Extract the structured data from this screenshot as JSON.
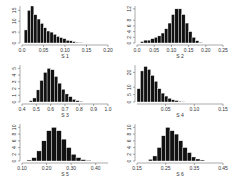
{
  "chart_data": [
    {
      "type": "bar",
      "title": "",
      "xlabel": "S 1",
      "ylabel": "",
      "xlim": [
        0.0,
        0.2
      ],
      "xticks": [
        "0.0",
        "0.05",
        "0.10",
        "0.15",
        "0.20"
      ],
      "yticks": [
        "0",
        "5",
        "10",
        "15"
      ],
      "ylim": [
        0,
        17
      ],
      "bin_start": 0.005,
      "bin_width": 0.0075,
      "values": [
        6,
        15,
        17,
        13,
        11,
        9,
        7,
        5.5,
        5,
        4,
        3,
        2.5,
        2,
        1.2,
        1,
        0.6,
        0.3,
        0.2
      ]
    },
    {
      "type": "bar",
      "title": "",
      "xlabel": "S 2",
      "ylabel": "",
      "xlim": [
        0.0,
        0.25
      ],
      "xticks": [
        "0.0",
        "0.05",
        "0.10",
        "0.15",
        "0.20",
        "0.25"
      ],
      "yticks": [
        "0",
        "2",
        "4",
        "6",
        "8",
        "12"
      ],
      "ylim": [
        0,
        13
      ],
      "bin_start": 0.01,
      "bin_width": 0.01,
      "values": [
        0.5,
        1,
        1,
        1.5,
        2,
        2.5,
        3.5,
        5,
        7,
        10,
        12,
        12,
        10,
        7,
        4,
        2,
        0.8,
        0.2
      ]
    },
    {
      "type": "bar",
      "title": "",
      "xlabel": "S 3",
      "ylabel": "",
      "xlim": [
        0.4,
        1.0
      ],
      "xticks": [
        "0.4",
        "0.5",
        "0.6",
        "0.7",
        "0.8",
        "0.9",
        "1.0"
      ],
      "yticks": [
        "0",
        "1",
        "2",
        "3",
        "4",
        "5"
      ],
      "ylim": [
        0,
        5.5
      ],
      "bin_start": 0.45,
      "bin_width": 0.025,
      "values": [
        0.2,
        0.6,
        1.8,
        3.2,
        4.4,
        5.0,
        4.8,
        3.8,
        2.8,
        1.9,
        1.2,
        0.8,
        0.4,
        0.2,
        0.1
      ]
    },
    {
      "type": "bar",
      "title": "",
      "xlabel": "S 4",
      "ylabel": "",
      "xlim": [
        0.0,
        0.15
      ],
      "xticks": [
        "0.05",
        "0.10",
        "0.15"
      ],
      "yticks": [
        "0",
        "5",
        "10",
        "20"
      ],
      "ylim": [
        0,
        25
      ],
      "bin_start": 0.0,
      "bin_width": 0.006,
      "values": [
        9,
        21,
        24,
        22,
        18,
        14,
        9,
        6,
        4,
        2.5,
        1.5,
        1,
        0.5,
        0.2
      ]
    },
    {
      "type": "bar",
      "title": "",
      "xlabel": "S 5",
      "ylabel": "",
      "xlim": [
        0.1,
        0.45
      ],
      "xticks": [
        "0.10",
        "0.20",
        "0.30",
        "0.40"
      ],
      "yticks": [
        "0",
        "2",
        "4",
        "6",
        "8",
        "10"
      ],
      "ylim": [
        0,
        11
      ],
      "bin_start": 0.12,
      "bin_width": 0.02,
      "values": [
        0.3,
        1,
        3,
        6,
        9,
        10,
        9,
        6.5,
        4,
        2,
        1,
        0.4,
        0.2
      ]
    },
    {
      "type": "bar",
      "title": "",
      "xlabel": "S 6",
      "ylabel": "",
      "xlim": [
        0.15,
        0.45
      ],
      "xticks": [
        "0.15",
        "0.25",
        "0.35",
        "0.45"
      ],
      "yticks": [
        "0",
        "2",
        "4",
        "6",
        "8",
        "10"
      ],
      "ylim": [
        0,
        11
      ],
      "bin_start": 0.19,
      "bin_width": 0.015,
      "values": [
        0.5,
        1.5,
        4,
        7.5,
        10,
        9,
        8,
        6,
        4,
        2.5,
        1.2,
        0.6,
        0.3
      ]
    }
  ]
}
